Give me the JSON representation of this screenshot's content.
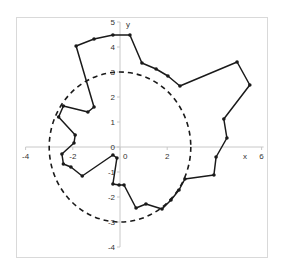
{
  "chart_data": {
    "type": "scatter",
    "title": "",
    "xlabel": "x",
    "ylabel": "y",
    "xlim": [
      -4,
      6
    ],
    "ylim": [
      -4,
      5
    ],
    "grid": false,
    "legend": null,
    "x_ticks": [
      -4,
      -2,
      0,
      2,
      6
    ],
    "x_tick_labels": [
      "-4",
      "-2",
      "0",
      "2",
      "6"
    ],
    "y_ticks": [
      5,
      4,
      3,
      2,
      1,
      0,
      -1,
      -2,
      -3,
      -4
    ],
    "y_tick_labels": [
      "5",
      "4",
      "3",
      "2",
      "1",
      "0",
      "-1",
      "-2",
      "-3",
      "-4"
    ],
    "series": [
      {
        "name": "polygon",
        "style": "solid line with markers",
        "color": "#1a1a1a",
        "closed": true,
        "points": [
          [
            0.42,
            4.48
          ],
          [
            -0.3,
            4.48
          ],
          [
            -1.1,
            4.32
          ],
          [
            -1.86,
            4.04
          ],
          [
            -1.1,
            1.6
          ],
          [
            -1.36,
            1.4
          ],
          [
            -2.4,
            1.64
          ],
          [
            -2.6,
            1.2
          ],
          [
            -1.9,
            0.48
          ],
          [
            -1.95,
            0.16
          ],
          [
            -2.46,
            -0.28
          ],
          [
            -2.4,
            -0.68
          ],
          [
            -2.08,
            -0.8
          ],
          [
            -1.6,
            -1.16
          ],
          [
            -0.3,
            -0.32
          ],
          [
            -0.13,
            -0.44
          ],
          [
            -0.3,
            -1.48
          ],
          [
            -0.04,
            -1.52
          ],
          [
            0.17,
            -1.52
          ],
          [
            0.68,
            -2.44
          ],
          [
            1.1,
            -2.28
          ],
          [
            1.78,
            -2.48
          ],
          [
            2.16,
            -2.12
          ],
          [
            2.5,
            -1.72
          ],
          [
            2.75,
            -1.28
          ],
          [
            3.98,
            -1.12
          ],
          [
            4.07,
            -0.4
          ],
          [
            4.53,
            0.36
          ],
          [
            4.4,
            1.12
          ],
          [
            5.5,
            2.48
          ],
          [
            4.96,
            3.4
          ],
          [
            2.54,
            2.44
          ],
          [
            2.03,
            2.84
          ],
          [
            1.53,
            3.12
          ],
          [
            0.93,
            3.36
          ]
        ]
      },
      {
        "name": "circle",
        "style": "dashed",
        "color": "#1a1a1a",
        "center": [
          0,
          0
        ],
        "radius": 3
      }
    ]
  }
}
